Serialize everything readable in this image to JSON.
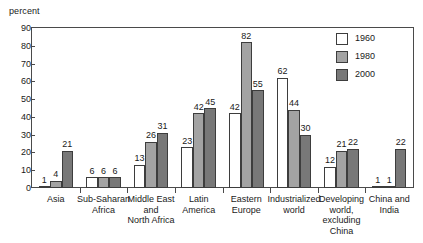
{
  "chart_data": {
    "type": "bar",
    "title": "",
    "subtitle": "",
    "xlabel": "",
    "ylabel": "percent",
    "ylim": [
      0,
      90
    ],
    "yticks": [
      0,
      10,
      20,
      30,
      40,
      50,
      60,
      70,
      80,
      90
    ],
    "grid": false,
    "legend_position": "top-right",
    "categories": [
      "Asia",
      "Sub-Saharan\nAfrica",
      "Middle East\nand\nNorth Africa",
      "Latin\nAmerica",
      "Eastern\nEurope",
      "Industrialized\nworld",
      "Developing\nworld,\nexcluding\nChina",
      "China and\nIndia"
    ],
    "series": [
      {
        "name": "1960",
        "color": "#ffffff",
        "values": [
          1,
          6,
          13,
          23,
          42,
          62,
          12,
          1
        ]
      },
      {
        "name": "1980",
        "color": "#a3a3a3",
        "values": [
          4,
          6,
          26,
          42,
          82,
          44,
          21,
          1
        ]
      },
      {
        "name": "2000",
        "color": "#787878",
        "values": [
          21,
          6,
          31,
          45,
          55,
          30,
          22,
          22
        ]
      }
    ]
  },
  "axis": {
    "y_title": "percent",
    "y_tick_labels": [
      "0",
      "10",
      "20",
      "30",
      "40",
      "50",
      "60",
      "70",
      "80",
      "90"
    ]
  },
  "legend": {
    "items": [
      {
        "label": "1960",
        "swatch": "s1960"
      },
      {
        "label": "1980",
        "swatch": "s1980"
      },
      {
        "label": "2000",
        "swatch": "s2000"
      }
    ]
  }
}
